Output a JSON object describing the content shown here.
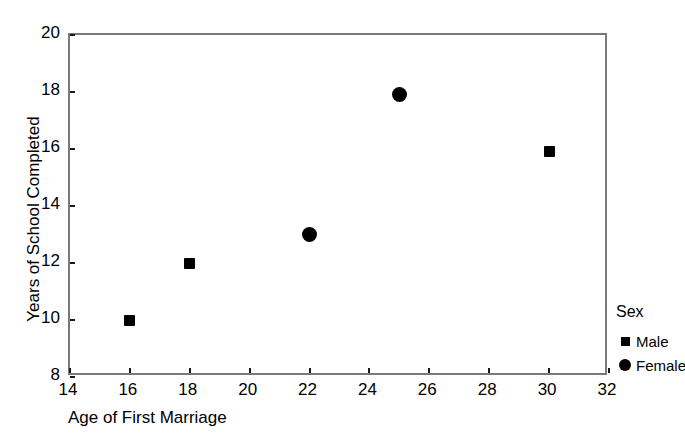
{
  "chart_data": {
    "type": "scatter",
    "title": "",
    "xlabel": "Age of First Marriage",
    "ylabel": "Years of School Completed",
    "xlim": [
      14,
      32
    ],
    "ylim": [
      8,
      20
    ],
    "xticks": [
      14,
      16,
      18,
      20,
      22,
      24,
      26,
      28,
      30,
      32
    ],
    "yticks": [
      8,
      10,
      12,
      14,
      16,
      18,
      20
    ],
    "xticklabels": [
      "14",
      "16",
      "18",
      "20",
      "22",
      "24",
      "26",
      "28",
      "30",
      "32"
    ],
    "yticklabels": [
      "8",
      "10",
      "12",
      "14",
      "16",
      "18",
      "20"
    ],
    "grid": false,
    "legend": {
      "title": "Sex",
      "position": "right",
      "entries": [
        {
          "name": "Male",
          "marker": "square"
        },
        {
          "name": "Female",
          "marker": "circle"
        }
      ]
    },
    "series": [
      {
        "name": "Male",
        "marker": "square",
        "color": "#000000",
        "points": [
          {
            "x": 16,
            "y": 10
          },
          {
            "x": 18,
            "y": 12
          },
          {
            "x": 30,
            "y": 15.9
          }
        ]
      },
      {
        "name": "Female",
        "marker": "circle",
        "color": "#000000",
        "points": [
          {
            "x": 22,
            "y": 13
          },
          {
            "x": 25,
            "y": 17.9
          }
        ]
      }
    ]
  },
  "axes": {
    "frame_color": "#7a7a7a",
    "tick_color": "#1a1a1a"
  }
}
